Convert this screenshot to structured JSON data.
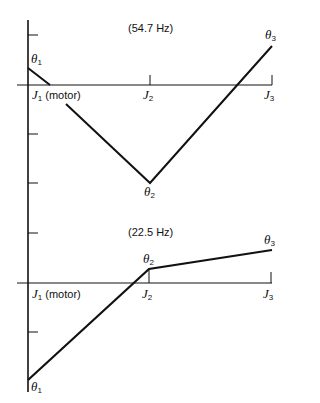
{
  "upper_mode": {
    "frequency_label": "(54.7 Hz)",
    "theta1": {
      "sym": "θ",
      "sub": "1"
    },
    "theta2": {
      "sym": "θ",
      "sub": "2"
    },
    "theta3": {
      "sym": "θ",
      "sub": "3"
    },
    "j1": {
      "sym": "J",
      "sub": "1",
      "suffix": "(motor)"
    },
    "j2": {
      "sym": "J",
      "sub": "2"
    },
    "j3": {
      "sym": "J",
      "sub": "3"
    }
  },
  "lower_mode": {
    "frequency_label": "(22.5 Hz)",
    "theta1": {
      "sym": "θ",
      "sub": "1"
    },
    "theta2": {
      "sym": "θ",
      "sub": "2"
    },
    "theta3": {
      "sym": "θ",
      "sub": "3"
    },
    "j1": {
      "sym": "J",
      "sub": "1",
      "suffix": "(motor)"
    },
    "j2": {
      "sym": "J",
      "sub": "2"
    },
    "j3": {
      "sym": "J",
      "sub": "3"
    }
  },
  "colors": {
    "ink": "#111111",
    "background": "#ffffff"
  }
}
